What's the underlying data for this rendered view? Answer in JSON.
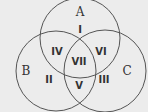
{
  "diagram": {
    "type": "venn",
    "background": "#ececec",
    "stroke_color": "#555555",
    "sets": [
      {
        "name": "A",
        "cx": 80,
        "cy": 38,
        "r": 40,
        "label_x": 80,
        "label_y": 12
      },
      {
        "name": "B",
        "cx": 56,
        "cy": 71,
        "r": 40,
        "label_x": 26,
        "label_y": 71
      },
      {
        "name": "C",
        "cx": 105,
        "cy": 71,
        "r": 41,
        "label_x": 127,
        "label_y": 71
      }
    ],
    "regions": [
      {
        "label": "I",
        "x": 80,
        "y": 30
      },
      {
        "label": "II",
        "x": 49,
        "y": 80
      },
      {
        "label": "III",
        "x": 104,
        "y": 80
      },
      {
        "label": "IV",
        "x": 57,
        "y": 52
      },
      {
        "label": "V",
        "x": 79,
        "y": 86
      },
      {
        "label": "VI",
        "x": 101,
        "y": 52
      },
      {
        "label": "VII",
        "x": 79,
        "y": 62
      }
    ]
  }
}
